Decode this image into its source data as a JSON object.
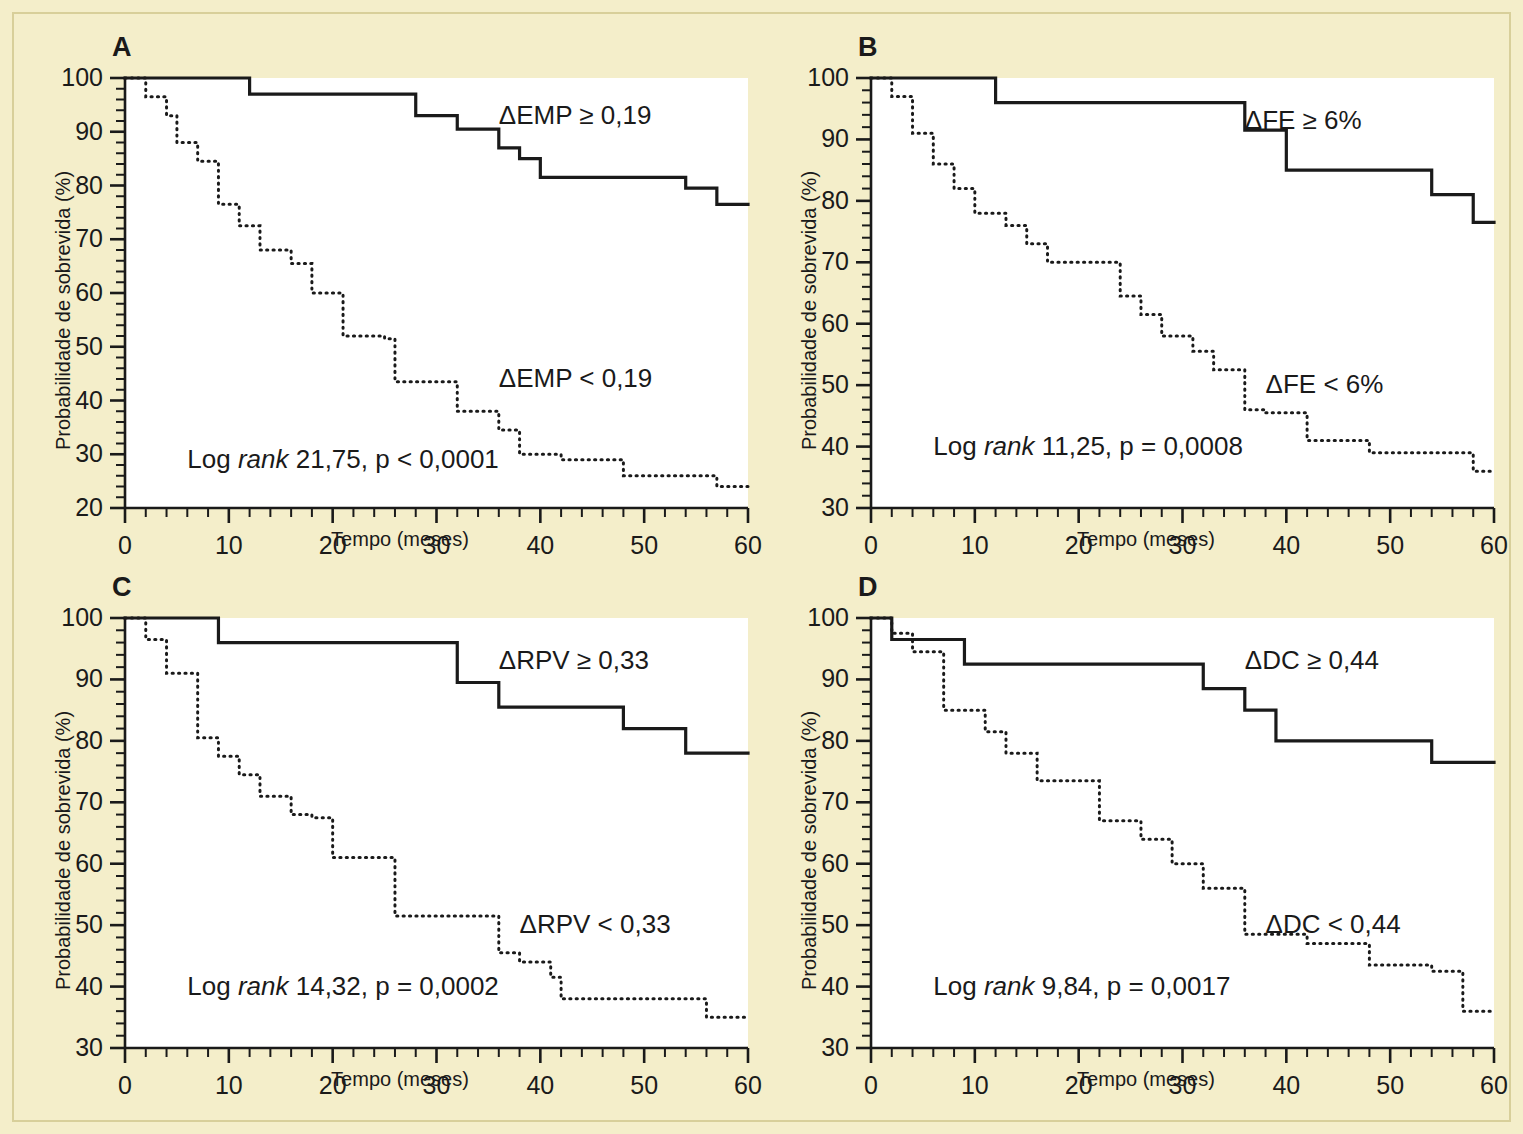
{
  "figure": {
    "background_color": "#f4eeca",
    "plot_background_color": "#ffffff",
    "line_color": "#1a1a1a",
    "axis_label_y": "Probabilidade de sobrevida (%)",
    "axis_label_x": "Tempo (meses)"
  },
  "panels": [
    {
      "letter": "A",
      "ylabel": "Probabilidade de sobrevida (%)",
      "xlabel": "Tempo (meses)",
      "stat_text_prefix": "Log ",
      "stat_text_italic": "rank",
      "stat_text_suffix": " 21,75, p < 0,0001",
      "label_high": "ΔEMP ≥ 0,19",
      "label_low": "ΔEMP < 0,19"
    },
    {
      "letter": "B",
      "ylabel": "Probabilidade de sobrevida (%)",
      "xlabel": "Tempo (meses)",
      "stat_text_prefix": "Log ",
      "stat_text_italic": "rank",
      "stat_text_suffix": " 11,25, p = 0,0008",
      "label_high": "ΔFE ≥ 6%",
      "label_low": "ΔFE < 6%"
    },
    {
      "letter": "C",
      "ylabel": "Probabilidade de sobrevida (%)",
      "xlabel": "Tempo (meses)",
      "stat_text_prefix": "Log ",
      "stat_text_italic": "rank",
      "stat_text_suffix": " 14,32, p = 0,0002",
      "label_high": "ΔRPV ≥ 0,33",
      "label_low": "ΔRPV < 0,33"
    },
    {
      "letter": "D",
      "ylabel": "Probabilidade de sobrevida (%)",
      "xlabel": "Tempo (meses)",
      "stat_text_prefix": "Log ",
      "stat_text_italic": "rank",
      "stat_text_suffix": " 9,84, p = 0,0017",
      "label_high": "ΔDC ≥ 0,44",
      "label_low": "ΔDC < 0,44"
    }
  ],
  "chart_data": [
    {
      "panel": "A",
      "type": "line",
      "title": "A",
      "xlabel": "Tempo (meses)",
      "ylabel": "Probabilidade de sobrevida (%)",
      "xlim": [
        0,
        60
      ],
      "ylim": [
        20,
        100
      ],
      "xticks": [
        0,
        10,
        20,
        30,
        40,
        50,
        60
      ],
      "yticks": [
        20,
        30,
        40,
        50,
        60,
        70,
        80,
        90,
        100
      ],
      "minor_tick_step_x": 2,
      "minor_tick_step_y": 2,
      "grid": false,
      "legend": "inline-annotations",
      "series": [
        {
          "name": "ΔEMP ≥ 0,19",
          "style": "solid",
          "step": "post",
          "x": [
            0,
            12,
            12,
            28,
            28,
            32,
            32,
            36,
            36,
            38,
            38,
            40,
            40,
            54,
            54,
            57,
            57,
            60
          ],
          "y": [
            100,
            100,
            97,
            97,
            93,
            93,
            90.5,
            90.5,
            87,
            87,
            85,
            85,
            81.5,
            81.5,
            79.5,
            79.5,
            76.5,
            76.5
          ]
        },
        {
          "name": "ΔEMP < 0,19",
          "style": "dotted",
          "step": "post",
          "x": [
            0,
            2,
            2,
            4,
            4,
            5,
            5,
            7,
            7,
            9,
            9,
            11,
            11,
            13,
            13,
            16,
            16,
            18,
            18,
            20,
            20,
            21,
            21,
            25,
            25,
            26,
            26,
            31,
            31,
            32,
            32,
            36,
            36,
            38,
            38,
            42,
            42,
            48,
            48,
            57,
            57,
            60
          ],
          "y": [
            100,
            100,
            96.5,
            96.5,
            93,
            93,
            88,
            88,
            84.5,
            84.5,
            76.5,
            76.5,
            72.5,
            72.5,
            68,
            68,
            65.5,
            65.5,
            60,
            60,
            60,
            60,
            52,
            52,
            51.5,
            51.5,
            43.5,
            43.5,
            43.5,
            43.5,
            38,
            38,
            34.5,
            34.5,
            30,
            30,
            29,
            29,
            26,
            26,
            24,
            24
          ]
        }
      ],
      "annotations": [
        {
          "text": "ΔEMP ≥ 0,19",
          "x": 36,
          "y": 93
        },
        {
          "text": "ΔEMP < 0,19",
          "x": 36,
          "y": 44
        },
        {
          "text": "Log rank 21,75, p < 0,0001",
          "x": 6,
          "y": 29
        }
      ]
    },
    {
      "panel": "B",
      "type": "line",
      "title": "B",
      "xlabel": "Tempo (meses)",
      "ylabel": "Probabilidade de sobrevida (%)",
      "xlim": [
        0,
        60
      ],
      "ylim": [
        30,
        100
      ],
      "xticks": [
        0,
        10,
        20,
        30,
        40,
        50,
        60
      ],
      "yticks": [
        30,
        40,
        50,
        60,
        70,
        80,
        90,
        100
      ],
      "minor_tick_step_x": 2,
      "minor_tick_step_y": 2,
      "grid": false,
      "legend": "inline-annotations",
      "series": [
        {
          "name": "ΔFE ≥ 6%",
          "style": "solid",
          "step": "post",
          "x": [
            0,
            12,
            12,
            32,
            32,
            36,
            36,
            40,
            40,
            54,
            54,
            58,
            58,
            60
          ],
          "y": [
            100,
            100,
            96,
            96,
            96,
            96,
            91.5,
            91.5,
            85,
            85,
            81,
            81,
            76.5,
            76.5
          ]
        },
        {
          "name": "ΔFE < 6%",
          "style": "dotted",
          "step": "post",
          "x": [
            0,
            2,
            2,
            4,
            4,
            6,
            6,
            8,
            8,
            10,
            10,
            13,
            13,
            15,
            15,
            17,
            17,
            20,
            20,
            24,
            24,
            26,
            26,
            28,
            28,
            31,
            31,
            33,
            33,
            36,
            36,
            38,
            38,
            42,
            42,
            48,
            48,
            58,
            58,
            60
          ],
          "y": [
            100,
            100,
            97,
            97,
            91,
            91,
            86,
            86,
            82,
            82,
            78,
            78,
            76,
            76,
            73,
            73,
            70,
            70,
            70,
            70,
            64.5,
            64.5,
            61.5,
            61.5,
            58,
            58,
            55.5,
            55.5,
            52.5,
            52.5,
            46,
            46,
            45.5,
            45.5,
            41,
            41,
            39,
            39,
            36,
            36
          ]
        }
      ],
      "annotations": [
        {
          "text": "ΔFE ≥ 6%",
          "x": 36,
          "y": 93
        },
        {
          "text": "ΔFE < 6%",
          "x": 38,
          "y": 50
        },
        {
          "text": "Log rank 11,25, p = 0,0008",
          "x": 6,
          "y": 40
        }
      ]
    },
    {
      "panel": "C",
      "type": "line",
      "title": "C",
      "xlabel": "Tempo (meses)",
      "ylabel": "Probabilidade de sobrevida (%)",
      "xlim": [
        0,
        60
      ],
      "ylim": [
        30,
        100
      ],
      "xticks": [
        0,
        10,
        20,
        30,
        40,
        50,
        60
      ],
      "yticks": [
        30,
        40,
        50,
        60,
        70,
        80,
        90,
        100
      ],
      "minor_tick_step_x": 2,
      "minor_tick_step_y": 2,
      "grid": false,
      "legend": "inline-annotations",
      "series": [
        {
          "name": "ΔRPV ≥ 0,33",
          "style": "solid",
          "step": "post",
          "x": [
            0,
            9,
            9,
            32,
            32,
            36,
            36,
            48,
            48,
            54,
            54,
            60
          ],
          "y": [
            100,
            100,
            96,
            96,
            89.5,
            89.5,
            85.5,
            85.5,
            82,
            82,
            78,
            78
          ]
        },
        {
          "name": "ΔRPV < 0,33",
          "style": "dotted",
          "step": "post",
          "x": [
            0,
            2,
            2,
            4,
            4,
            7,
            7,
            9,
            9,
            11,
            11,
            13,
            13,
            16,
            16,
            18,
            18,
            20,
            20,
            25,
            25,
            26,
            26,
            28,
            28,
            36,
            36,
            38,
            38,
            41,
            41,
            42,
            42,
            54,
            54,
            56,
            56,
            60
          ],
          "y": [
            100,
            100,
            96.5,
            96.5,
            91,
            91,
            80.5,
            80.5,
            77.5,
            77.5,
            74.5,
            74.5,
            71,
            71,
            68,
            68,
            67.5,
            67.5,
            61,
            61,
            61,
            61,
            51.5,
            51.5,
            51.5,
            51.5,
            45.5,
            45.5,
            44,
            44,
            41.5,
            41.5,
            38,
            38,
            38,
            38,
            35,
            35
          ]
        }
      ],
      "annotations": [
        {
          "text": "ΔRPV ≥ 0,33",
          "x": 36,
          "y": 93
        },
        {
          "text": "ΔRPV < 0,33",
          "x": 38,
          "y": 50
        },
        {
          "text": "Log rank 14,32, p = 0,0002",
          "x": 6,
          "y": 40
        }
      ]
    },
    {
      "panel": "D",
      "type": "line",
      "title": "D",
      "xlabel": "Tempo (meses)",
      "ylabel": "Probabilidade de sobrevida (%)",
      "xlim": [
        0,
        60
      ],
      "ylim": [
        30,
        100
      ],
      "xticks": [
        0,
        10,
        20,
        30,
        40,
        50,
        60
      ],
      "yticks": [
        30,
        40,
        50,
        60,
        70,
        80,
        90,
        100
      ],
      "minor_tick_step_x": 2,
      "minor_tick_step_y": 2,
      "grid": false,
      "legend": "inline-annotations",
      "series": [
        {
          "name": "ΔDC ≥ 0,44",
          "style": "solid",
          "step": "post",
          "x": [
            0,
            2,
            2,
            9,
            9,
            32,
            32,
            36,
            36,
            39,
            39,
            54,
            54,
            60
          ],
          "y": [
            100,
            100,
            96.5,
            96.5,
            92.5,
            92.5,
            88.5,
            88.5,
            85,
            85,
            80,
            80,
            76.5,
            76.5
          ]
        },
        {
          "name": "ΔDC < 0,44",
          "style": "dotted",
          "step": "post",
          "x": [
            0,
            2,
            2,
            4,
            4,
            7,
            7,
            11,
            11,
            13,
            13,
            16,
            16,
            20,
            20,
            22,
            22,
            26,
            26,
            29,
            29,
            32,
            32,
            35,
            35,
            36,
            36,
            42,
            42,
            48,
            48,
            54,
            54,
            57,
            57,
            60
          ],
          "y": [
            100,
            100,
            97.5,
            97.5,
            94.5,
            94.5,
            85,
            85,
            81.5,
            81.5,
            78,
            78,
            73.5,
            73.5,
            73.5,
            73.5,
            67,
            67,
            64,
            64,
            60,
            60,
            56,
            56,
            56,
            56,
            48.5,
            48.5,
            47,
            47,
            43.5,
            43.5,
            42.5,
            42.5,
            36,
            36
          ]
        }
      ],
      "annotations": [
        {
          "text": "ΔDC ≥ 0,44",
          "x": 36,
          "y": 93
        },
        {
          "text": "ΔDC < 0,44",
          "x": 38,
          "y": 50
        },
        {
          "text": "Log rank 9,84, p = 0,0017",
          "x": 6,
          "y": 40
        }
      ]
    }
  ]
}
